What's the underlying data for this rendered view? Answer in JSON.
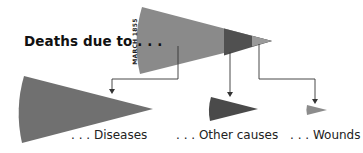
{
  "title": "Deaths due to . . .",
  "month_label": "MARCH 1855",
  "categories": [
    {
      "key": "diseases",
      "label": ". . . Diseases",
      "color": "#707070"
    },
    {
      "key": "other",
      "label": ". . . Other causes",
      "color": "#4a4a4a"
    },
    {
      "key": "wounds",
      "label": ". . . Wounds",
      "color": "#8c8c8c"
    }
  ],
  "colors": {
    "combined_wedge": "#8a8a8a",
    "other_segment": "#505050",
    "wounds_segment": "#9a9a9a",
    "arrow": "#333333"
  }
}
